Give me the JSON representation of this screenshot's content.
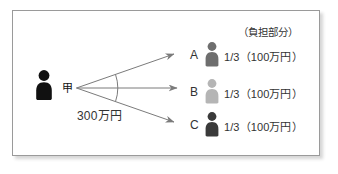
{
  "diagram": {
    "type": "obligation-split-diagram",
    "debtor": {
      "label": "甲",
      "icon": "person-icon",
      "color": "#111111"
    },
    "total_amount_label": "300万円",
    "header_label": "（負担部分）",
    "creditors": [
      {
        "letter": "A",
        "icon": "person-icon",
        "color": "#6e6e6e",
        "share_label": "1/3（100万円）"
      },
      {
        "letter": "B",
        "icon": "person-icon",
        "color": "#b5b5b5",
        "share_label": "1/3（100万円）"
      },
      {
        "letter": "C",
        "icon": "person-icon",
        "color": "#3a3a3a",
        "share_label": "1/3（100万円）"
      }
    ],
    "colors": {
      "frame_border": "#9a9a9a",
      "arrow": "#7b7b7b",
      "arc": "#7b7b7b",
      "background": "#ffffff",
      "text": "#333333"
    }
  }
}
